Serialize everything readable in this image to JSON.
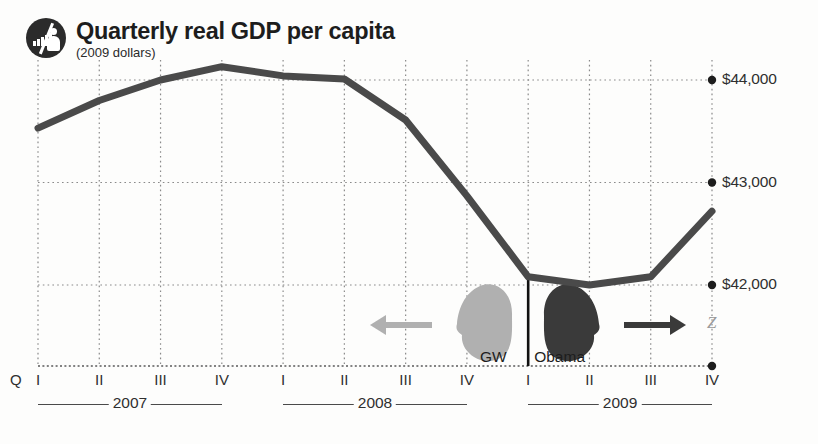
{
  "header": {
    "title": "Quarterly real GDP per capita",
    "subtitle": "(2009 dollars)",
    "logo_icon": "bar-chart-person-badge-icon"
  },
  "annotations": {
    "gw": {
      "label": "GW",
      "head_icon": "gw-bush-head-silhouette-icon",
      "arrow_icon": "left-arrow-icon",
      "color": "#b0b0b0"
    },
    "obama": {
      "label": "Obama",
      "head_icon": "obama-head-silhouette-icon",
      "arrow_icon": "right-arrow-icon",
      "color": "#3a3a3a"
    },
    "divider_icon": "inauguration-divider-line",
    "scan_artifact": "Z"
  },
  "chart_data": {
    "type": "line",
    "title": "Quarterly real GDP per capita",
    "subtitle": "(2009 dollars)",
    "xlabel": "",
    "ylabel": "",
    "grid": true,
    "legend": false,
    "ylim": [
      41500,
      44300
    ],
    "yticks": [
      42000,
      43000,
      44000
    ],
    "ytick_labels": [
      "$42,000",
      "$43,000",
      "$44,000"
    ],
    "quarter_prefix": "Q",
    "categories": [
      "2007 I",
      "2007 II",
      "2007 III",
      "2007 IV",
      "2008 I",
      "2008 II",
      "2008 III",
      "2008 IV",
      "2009 I",
      "2009 II",
      "2009 III",
      "2009 IV"
    ],
    "quarter_labels": [
      "I",
      "II",
      "III",
      "IV",
      "I",
      "II",
      "III",
      "IV",
      "I",
      "II",
      "III",
      "IV"
    ],
    "year_groups": [
      {
        "year": "2007",
        "start_index": 0,
        "end_index": 3
      },
      {
        "year": "2008",
        "start_index": 4,
        "end_index": 7
      },
      {
        "year": "2009",
        "start_index": 8,
        "end_index": 11
      }
    ],
    "values": [
      43530,
      43800,
      44000,
      44130,
      44040,
      44010,
      43610,
      42870,
      42080,
      42000,
      42080,
      42720
    ],
    "series_color": "#4a4a4a",
    "line_width": 7
  }
}
